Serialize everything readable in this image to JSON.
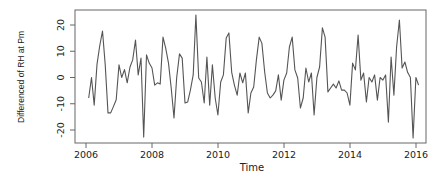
{
  "chart_data": {
    "type": "line",
    "title": "",
    "xlabel": "Time",
    "ylabel": "Differenced of RH at Pm",
    "xlim": [
      2006,
      2016
    ],
    "ylim": [
      -24,
      24
    ],
    "grid": false,
    "legend": null,
    "x_ticks": [
      "2006",
      "2008",
      "2010",
      "2012",
      "2014",
      "2016"
    ],
    "x_tick_values": [
      2006,
      2008,
      2010,
      2012,
      2014,
      2016
    ],
    "y_ticks": [
      "-20",
      "-10",
      "0",
      "10",
      "20"
    ],
    "y_tick_values": [
      -20,
      -10,
      0,
      10,
      20
    ],
    "x_start": 2006.083,
    "x_step": 0.0833,
    "series": [
      {
        "name": "Differenced RH at Pm",
        "color": "#555555",
        "values": [
          -7.8,
          0,
          -10.5,
          5,
          12,
          17.7,
          5,
          -13.5,
          -13.5,
          -11,
          -8.5,
          4.8,
          0,
          3,
          -2,
          4,
          6.7,
          14.3,
          1,
          7.4,
          -22.7,
          8.6,
          5.5,
          3.6,
          -2.9,
          -2,
          -2.5,
          15.4,
          11.2,
          5.5,
          -4,
          -15.4,
          0,
          9,
          7.4,
          -9.7,
          -9.3,
          -4.8,
          1,
          23.8,
          -0.2,
          -1.7,
          -9.7,
          7.8,
          -10.5,
          4.8,
          -7.8,
          -14.3,
          -1.7,
          1,
          15,
          17,
          2,
          -2.9,
          -6.7,
          1.7,
          -2,
          1.7,
          -13.5,
          -5.9,
          -3.6,
          6.7,
          15.4,
          13,
          2,
          -5.9,
          -7.8,
          -6.7,
          -5.1,
          1,
          -8.6,
          -1,
          1.7,
          11.6,
          15.4,
          2.9,
          -0.2,
          -11.6,
          -7.8,
          3.6,
          -1.7,
          1.7,
          -14.3,
          0,
          4,
          18.9,
          15.4,
          -5.5,
          -4,
          -2.5,
          -4,
          -1.3,
          -4.8,
          -4.8,
          -5.9,
          -10.5,
          5.5,
          2.9,
          16.2,
          -1,
          1.7,
          -9.3,
          0,
          -1.7,
          1,
          -8.6,
          0,
          -1,
          1,
          -17,
          7.8,
          -6.7,
          11.6,
          21.9,
          3.6,
          5.9,
          2,
          0,
          -23,
          0,
          -2.9
        ]
      }
    ]
  },
  "colors": {
    "line": "#555555",
    "axis": "#555555",
    "text": "#222222",
    "background": "#ffffff"
  }
}
